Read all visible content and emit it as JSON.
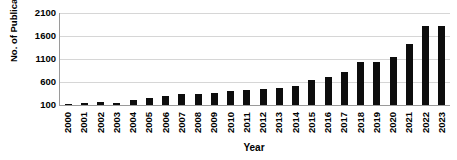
{
  "chart_data": {
    "type": "bar",
    "title": "",
    "subtitle": "",
    "xlabel": "Year",
    "ylabel": "No. of Publications",
    "grid": true,
    "legend": null,
    "legend_position": "none",
    "bar_color": "#0d0d0d",
    "gridline_color": "#d6d6d6",
    "axis_color": "#9a9a9a",
    "ylim": [
      100,
      2100
    ],
    "ytick_interval": 500,
    "yticks": [
      2100,
      1600,
      1100,
      600,
      100
    ],
    "categories": [
      "2000",
      "2001",
      "2002",
      "2003",
      "2004",
      "2005",
      "2006",
      "2007",
      "2008",
      "2009",
      "2010",
      "2011",
      "2012",
      "2013",
      "2014",
      "2015",
      "2016",
      "2017",
      "2018",
      "2019",
      "2020",
      "2021",
      "2022",
      "2023"
    ],
    "values": [
      110,
      135,
      175,
      140,
      210,
      250,
      290,
      330,
      330,
      355,
      400,
      420,
      440,
      460,
      520,
      640,
      700,
      820,
      1030,
      1035,
      1145,
      1430,
      1810,
      1815
    ],
    "values_2023_partial_note": "",
    "annotations": []
  },
  "axis_titles": {
    "y": "No. of Publications",
    "x": "Year"
  }
}
